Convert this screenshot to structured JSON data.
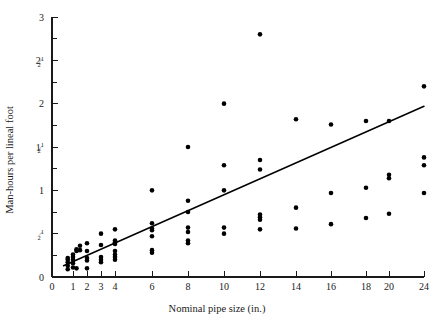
{
  "chart_data": {
    "type": "scatter",
    "title": "",
    "xlabel": "Nominal pipe size (in.)",
    "ylabel": "Man-hours per lineal foot",
    "grid": false,
    "legend": null,
    "xtick_labels": [
      "0",
      "1",
      "2",
      "3",
      "4",
      "6",
      "8",
      "10",
      "12",
      "14",
      "16",
      "18",
      "20",
      "24"
    ],
    "xtick_values": [
      0,
      1,
      2,
      3,
      4,
      6,
      8,
      10,
      12,
      14,
      16,
      18,
      20,
      24
    ],
    "ytick_labels": [
      "0",
      "1/2",
      "1",
      "1 1/2",
      "2",
      "2 1/2",
      "3"
    ],
    "ytick_values": [
      0,
      0.5,
      1,
      1.5,
      2,
      2.5,
      3
    ],
    "ytick_minor_values": [
      0.25,
      0.75,
      1.25,
      1.75,
      2.25,
      2.75
    ],
    "xlim": [
      0,
      25.2
    ],
    "ylim": [
      0,
      3
    ],
    "series": [
      {
        "name": "Pipe installation observations",
        "points": [
          [
            0.75,
            0.22
          ],
          [
            0.75,
            0.2
          ],
          [
            0.75,
            0.17
          ],
          [
            0.75,
            0.13
          ],
          [
            0.75,
            0.09
          ],
          [
            1.0,
            0.26
          ],
          [
            1.0,
            0.23
          ],
          [
            1.0,
            0.2
          ],
          [
            1.0,
            0.16
          ],
          [
            1.0,
            0.11
          ],
          [
            1.25,
            0.32
          ],
          [
            1.25,
            0.3
          ],
          [
            1.25,
            0.1
          ],
          [
            1.5,
            0.36
          ],
          [
            1.5,
            0.31
          ],
          [
            2.0,
            0.39
          ],
          [
            2.0,
            0.3
          ],
          [
            2.0,
            0.22
          ],
          [
            2.0,
            0.19
          ],
          [
            2.0,
            0.1
          ],
          [
            3.0,
            0.5
          ],
          [
            3.0,
            0.37
          ],
          [
            3.0,
            0.23
          ],
          [
            3.0,
            0.2
          ],
          [
            3.0,
            0.17
          ],
          [
            4.0,
            0.55
          ],
          [
            4.0,
            0.42
          ],
          [
            4.0,
            0.4
          ],
          [
            4.0,
            0.38
          ],
          [
            4.0,
            0.3
          ],
          [
            4.0,
            0.26
          ],
          [
            4.0,
            0.23
          ],
          [
            4.0,
            0.2
          ],
          [
            6.0,
            1.0
          ],
          [
            6.0,
            0.62
          ],
          [
            6.0,
            0.56
          ],
          [
            6.0,
            0.54
          ],
          [
            6.0,
            0.47
          ],
          [
            6.0,
            0.31
          ],
          [
            6.0,
            0.28
          ],
          [
            8.0,
            1.5
          ],
          [
            8.0,
            0.88
          ],
          [
            8.0,
            0.75
          ],
          [
            8.0,
            0.57
          ],
          [
            8.0,
            0.52
          ],
          [
            8.0,
            0.42
          ],
          [
            8.0,
            0.39
          ],
          [
            10.0,
            2.0
          ],
          [
            10.0,
            1.29
          ],
          [
            10.0,
            1.0
          ],
          [
            10.0,
            0.57
          ],
          [
            10.0,
            0.5
          ],
          [
            12.0,
            2.8
          ],
          [
            12.0,
            1.35
          ],
          [
            12.0,
            1.24
          ],
          [
            12.0,
            0.72
          ],
          [
            12.0,
            0.69
          ],
          [
            12.0,
            0.66
          ],
          [
            12.0,
            0.55
          ],
          [
            14.0,
            1.82
          ],
          [
            14.0,
            0.8
          ],
          [
            14.0,
            0.56
          ],
          [
            16.0,
            1.76
          ],
          [
            16.0,
            0.97
          ],
          [
            16.0,
            0.61
          ],
          [
            18.0,
            1.8
          ],
          [
            18.0,
            1.03
          ],
          [
            18.0,
            0.68
          ],
          [
            20.0,
            1.8
          ],
          [
            20.0,
            1.18
          ],
          [
            20.0,
            1.14
          ],
          [
            20.0,
            0.73
          ],
          [
            24.0,
            2.2
          ],
          [
            24.0,
            1.38
          ],
          [
            24.0,
            1.29
          ],
          [
            24.0,
            0.97
          ]
        ]
      }
    ],
    "fit_line": {
      "name": "regression line",
      "x_start": 0.55,
      "y_start": 0.13,
      "x_end": 24.6,
      "y_end": 1.97
    }
  }
}
